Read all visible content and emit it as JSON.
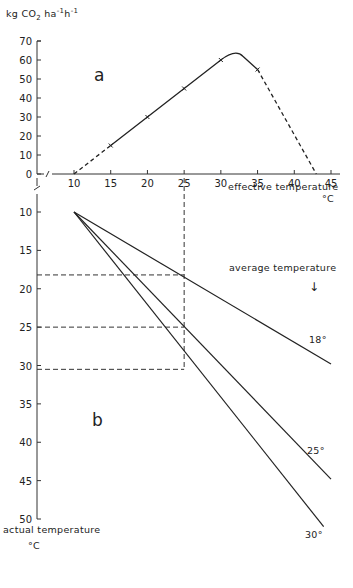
{
  "chart_data": [
    {
      "panel": "a",
      "type": "line",
      "title": "",
      "panel_label": "a",
      "ylabel": "kg CO2 ha-1 h-1",
      "ylabel_parts": {
        "base": "kg CO",
        "sub": "2",
        "rest": " ha",
        "sup1": "-1",
        "mid": "h",
        "sup2": "-1"
      },
      "xlabel": "effective temperature",
      "xunit": "°C",
      "xlim": [
        5,
        45
      ],
      "ylim": [
        0,
        70
      ],
      "xticks": [
        10,
        15,
        20,
        25,
        30,
        35,
        40,
        45
      ],
      "yticks": [
        0,
        10,
        20,
        30,
        40,
        50,
        60,
        70
      ],
      "axis_break": true,
      "series": [
        {
          "name": "CO2 assimilation",
          "x": [
            10,
            15,
            20,
            25,
            30,
            32,
            35,
            43
          ],
          "y": [
            0,
            15,
            30,
            45,
            60,
            63,
            55,
            0
          ],
          "markers": [
            [
              15,
              15
            ],
            [
              20,
              30
            ],
            [
              25,
              45
            ],
            [
              30,
              60
            ],
            [
              35,
              55
            ]
          ],
          "style_segments": [
            {
              "from": 10,
              "to": 15,
              "style": "dashed"
            },
            {
              "from": 15,
              "to": 35,
              "style": "solid"
            },
            {
              "from": 35,
              "to": 43,
              "style": "dashed"
            }
          ]
        }
      ]
    },
    {
      "panel": "b",
      "type": "line",
      "panel_label": "b",
      "ylabel": "actual temperature",
      "yunit": "°C",
      "ylim": [
        50,
        5
      ],
      "yticks": [
        10,
        15,
        20,
        25,
        30,
        35,
        40,
        45,
        50
      ],
      "shared_x": "effective temperature",
      "legend_title": "average temperature",
      "legend_arrow": "↓",
      "series": [
        {
          "name": "18°",
          "x": [
            10,
            45
          ],
          "y": [
            10,
            29.8
          ]
        },
        {
          "name": "25°",
          "x": [
            10,
            45
          ],
          "y": [
            10,
            44.8
          ]
        },
        {
          "name": "30°",
          "x": [
            10,
            44
          ],
          "y": [
            10,
            51
          ]
        }
      ],
      "reference_lines": {
        "vertical_at_x": 25,
        "horizontal_at_y": [
          18.2,
          25,
          30.5
        ]
      }
    }
  ]
}
